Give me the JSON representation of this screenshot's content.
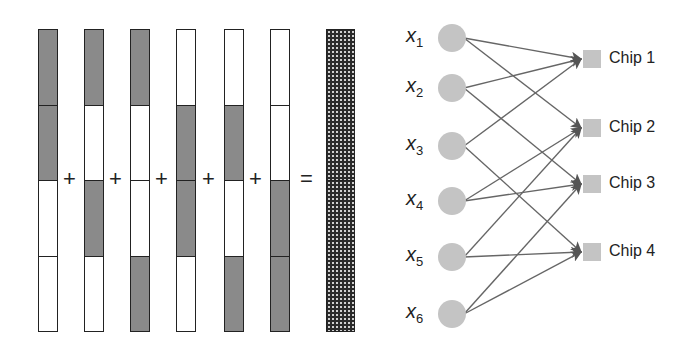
{
  "left_panel": {
    "columns": [
      {
        "segments": [
          "g",
          "g",
          "w",
          "w"
        ]
      },
      {
        "segments": [
          "g",
          "w",
          "g",
          "w"
        ]
      },
      {
        "segments": [
          "g",
          "w",
          "w",
          "g"
        ]
      },
      {
        "segments": [
          "w",
          "g",
          "g",
          "w"
        ]
      },
      {
        "segments": [
          "w",
          "g",
          "w",
          "g"
        ]
      },
      {
        "segments": [
          "w",
          "w",
          "g",
          "g"
        ]
      }
    ],
    "result": {
      "segments": [
        "d",
        "d",
        "d",
        "d"
      ]
    },
    "operators": [
      "+",
      "+",
      "+",
      "+",
      "+",
      "="
    ]
  },
  "right_panel": {
    "inputs": [
      {
        "var": "x",
        "sub": "1"
      },
      {
        "var": "x",
        "sub": "2"
      },
      {
        "var": "x",
        "sub": "3"
      },
      {
        "var": "x",
        "sub": "4"
      },
      {
        "var": "x",
        "sub": "5"
      },
      {
        "var": "x",
        "sub": "6"
      }
    ],
    "chips": [
      "Chip 1",
      "Chip 2",
      "Chip 3",
      "Chip 4"
    ],
    "edges": [
      [
        1,
        1
      ],
      [
        1,
        2
      ],
      [
        2,
        1
      ],
      [
        2,
        3
      ],
      [
        3,
        1
      ],
      [
        3,
        4
      ],
      [
        4,
        2
      ],
      [
        4,
        3
      ],
      [
        5,
        2
      ],
      [
        5,
        4
      ],
      [
        6,
        3
      ],
      [
        6,
        4
      ]
    ]
  },
  "colors": {
    "gray_fill": "#8a8a8a",
    "node_fill": "#c4c4c4",
    "edge": "#666666",
    "outline": "#222222"
  }
}
